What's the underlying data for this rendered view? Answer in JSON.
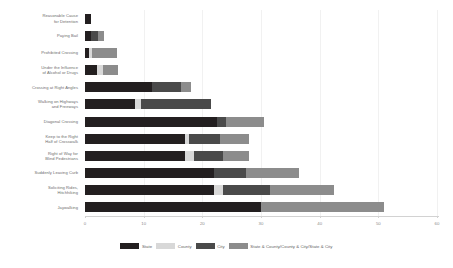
{
  "chart_data": {
    "type": "bar",
    "orientation": "horizontal",
    "stacked": true,
    "title": "",
    "xlabel": "",
    "ylabel": "",
    "xlim": [
      0,
      60
    ],
    "xticks": [
      0,
      10,
      20,
      30,
      40,
      50,
      60
    ],
    "grid": false,
    "legend_position": "bottom",
    "categories": [
      "Reasonable Cause\nfor Detention",
      "Paying Bail",
      "Prohibited Crossing",
      "Under the Influence\nof Alcohol or Drugs",
      "Crossing at Right Angles",
      "Walking on Highways\nand Freeways",
      "Diagonal Crossing",
      "Keep to the Right\nHalf of Crosswalk",
      "Right of Way for\nBlind Pedestrians",
      "Suddenly Leaving Curb",
      "Soliciting Rides,\nHitchhiking",
      "Jaywalking"
    ],
    "series": [
      {
        "name": "State",
        "color": "#231f20",
        "values": [
          1,
          1,
          0.7,
          2,
          11.5,
          8.5,
          22.5,
          17,
          17,
          22,
          22,
          30
        ]
      },
      {
        "name": "County",
        "color": "#d8d8d8",
        "values": [
          0,
          0,
          0.5,
          1,
          0,
          1,
          0,
          0.7,
          1.5,
          0,
          1.5,
          0
        ]
      },
      {
        "name": "City",
        "color": "#4a4a4a",
        "values": [
          0,
          1.2,
          0,
          0,
          4.8,
          12,
          1.5,
          5.3,
          5,
          5.5,
          8,
          0
        ]
      },
      {
        "name": "State & County/County & City/State & City",
        "color": "#8c8c8c",
        "values": [
          0,
          1,
          4.3,
          2.7,
          1.7,
          0,
          6.5,
          5,
          4.5,
          9,
          11,
          21
        ]
      }
    ]
  },
  "legend": {
    "items": [
      {
        "label": "State"
      },
      {
        "label": "County"
      },
      {
        "label": "City"
      },
      {
        "label": "State & County/County & City/State & City"
      }
    ]
  }
}
